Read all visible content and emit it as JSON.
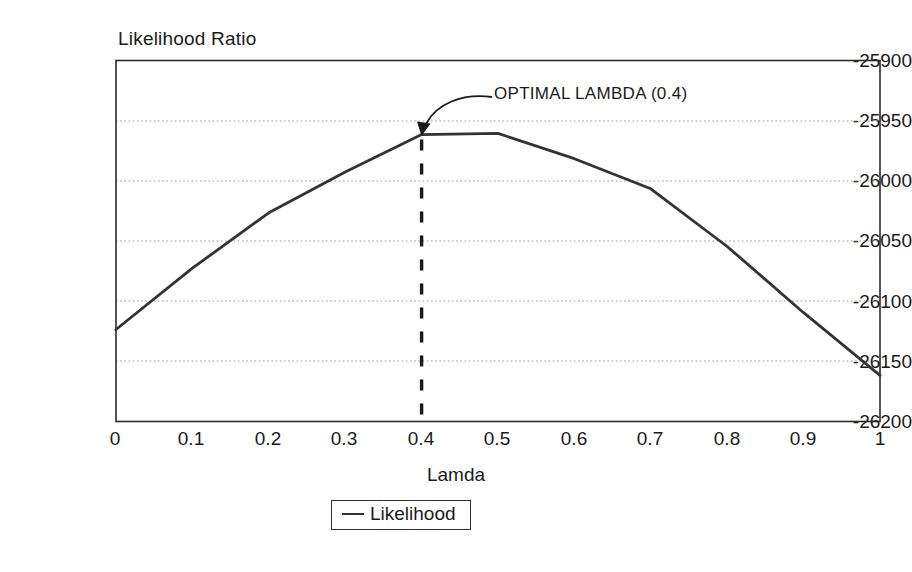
{
  "chart_data": {
    "type": "line",
    "title": "",
    "ylabel": "Likelihood Ratio",
    "xlabel": "Lamda",
    "xlim": [
      0,
      1
    ],
    "ylim": [
      -26200,
      -25900
    ],
    "grid": true,
    "legend_position": "bottom",
    "legend": [
      "Likelihood"
    ],
    "xticks": [
      "0",
      "0.1",
      "0.2",
      "0.3",
      "0.4",
      "0.5",
      "0.6",
      "0.7",
      "0.8",
      "0.9",
      "1"
    ],
    "yticks": [
      "-25900",
      "-25950",
      "-26000",
      "-26050",
      "-26100",
      "-26150",
      "-26200"
    ],
    "x": [
      0,
      0.1,
      0.2,
      0.3,
      0.4,
      0.5,
      0.6,
      0.7,
      0.8,
      0.9,
      1
    ],
    "series": [
      {
        "name": "Likelihood",
        "values": [
          -26124,
          -26073,
          -26027,
          -25993,
          -25962,
          -25961,
          -25982,
          -26007,
          -26055,
          -26110,
          -26162
        ],
        "color": "#333333"
      }
    ],
    "annotations": [
      {
        "text": "OPTIMAL LAMBDA (0.4)",
        "points_to_x": 0.4,
        "points_to_y": -25962,
        "marker": "dashed-vertical-line"
      }
    ]
  },
  "axis": {
    "ylabel_title": "Likelihood Ratio",
    "xlabel_title": "Lamda",
    "yticks": [
      {
        "label": "-25900"
      },
      {
        "label": "-25950"
      },
      {
        "label": "-26000"
      },
      {
        "label": "-26050"
      },
      {
        "label": "-26100"
      },
      {
        "label": "-26150"
      },
      {
        "label": "-26200"
      }
    ],
    "xticks": [
      {
        "label": "0"
      },
      {
        "label": "0.1"
      },
      {
        "label": "0.2"
      },
      {
        "label": "0.3"
      },
      {
        "label": "0.4"
      },
      {
        "label": "0.5"
      },
      {
        "label": "0.6"
      },
      {
        "label": "0.7"
      },
      {
        "label": "0.8"
      },
      {
        "label": "0.9"
      },
      {
        "label": "1"
      }
    ]
  },
  "legend": {
    "entries": [
      {
        "label": "Likelihood",
        "color": "#333333"
      }
    ]
  },
  "annotation": {
    "text": "OPTIMAL LAMBDA (0.4)"
  }
}
